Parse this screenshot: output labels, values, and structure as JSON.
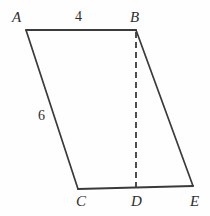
{
  "figure": {
    "background_color": "#fefefe",
    "stroke_color": "#3a3a3a",
    "stroke_width": 1.8,
    "width": 210,
    "height": 216,
    "vertices": [
      {
        "name": "A",
        "label": "A",
        "x": 26,
        "y": 30,
        "label_x": 12,
        "label_y": 10
      },
      {
        "name": "B",
        "label": "B",
        "x": 136,
        "y": 30,
        "label_x": 130,
        "label_y": 10
      },
      {
        "name": "C",
        "label": "C",
        "x": 78,
        "y": 189,
        "label_x": 76,
        "label_y": 194
      },
      {
        "name": "D",
        "label": "D",
        "x": 136,
        "y": 187,
        "label_x": 131,
        "label_y": 194
      },
      {
        "name": "E",
        "label": "E",
        "x": 193,
        "y": 186,
        "label_x": 190,
        "label_y": 194
      }
    ],
    "edges": [
      {
        "name": "edge-AB",
        "from": "A",
        "to": "B",
        "style": "solid",
        "x1": 26,
        "y1": 30,
        "x2": 136,
        "y2": 30
      },
      {
        "name": "edge-AC",
        "from": "A",
        "to": "C",
        "style": "solid",
        "x1": 26,
        "y1": 30,
        "x2": 78,
        "y2": 189
      },
      {
        "name": "edge-CE",
        "from": "C",
        "to": "E",
        "style": "solid",
        "x1": 78,
        "y1": 189,
        "x2": 193,
        "y2": 186
      },
      {
        "name": "edge-BE",
        "from": "B",
        "to": "E",
        "style": "solid",
        "x1": 136,
        "y1": 30,
        "x2": 193,
        "y2": 186
      },
      {
        "name": "edge-BD",
        "from": "B",
        "to": "D",
        "style": "dashed",
        "x1": 136,
        "y1": 31,
        "x2": 136,
        "y2": 187
      }
    ],
    "measurements": [
      {
        "name": "length-AB",
        "value": "4",
        "edge": "AB",
        "x": 75,
        "y": 10
      },
      {
        "name": "length-AC",
        "value": "6",
        "edge": "AC",
        "x": 38,
        "y": 109
      }
    ],
    "dash_pattern": "6,4"
  }
}
